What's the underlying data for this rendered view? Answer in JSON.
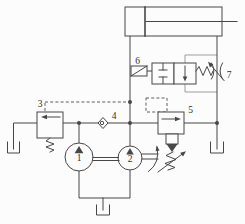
{
  "diagram": {
    "kind": "hydraulic-circuit-schematic",
    "labels": {
      "n1": "1",
      "n2": "2",
      "n3": "3",
      "n4": "4",
      "n5": "5",
      "n6": "6",
      "n7": "7"
    },
    "components": {
      "1": "pump",
      "2": "pump-with-drive-shaft",
      "3": "pilot-operated-relief-valve",
      "4": "check-valve",
      "5": "adjustable-pressure-valve",
      "6": "solenoid-two-position-valve",
      "7": "adjustable-throttle"
    },
    "colors": {
      "line": "#474747",
      "light_line": "#9d9d9d",
      "dashed_line": "#5d5d5d",
      "background": "#fcfcfc",
      "label": "#2e2e2e"
    }
  }
}
